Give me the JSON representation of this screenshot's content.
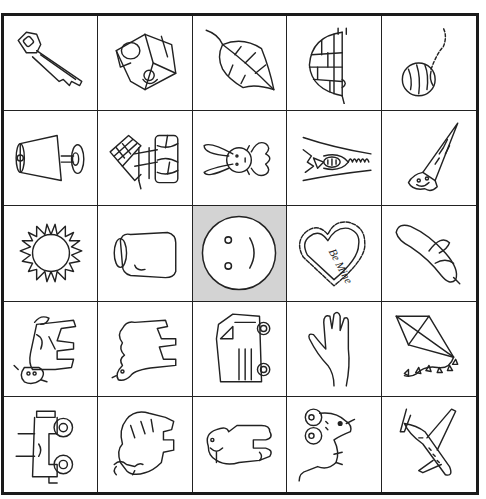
{
  "board": {
    "rows": 5,
    "cols": 5,
    "free_cell_color": "#d3d3d3",
    "cells": [
      {
        "label": "key",
        "icon": "key-icon"
      },
      {
        "label": "milk carton",
        "icon": "milk-carton-icon"
      },
      {
        "label": "leaf",
        "icon": "leaf-icon"
      },
      {
        "label": "igloo",
        "icon": "igloo-icon"
      },
      {
        "label": "yarn",
        "icon": "yarn-ball-icon"
      },
      {
        "label": "lamp",
        "icon": "lamp-icon"
      },
      {
        "label": "well",
        "icon": "wishing-well-icon"
      },
      {
        "label": "rabbit",
        "icon": "rabbit-icon"
      },
      {
        "label": "zipper",
        "icon": "zipper-icon"
      },
      {
        "label": "saw",
        "icon": "saw-icon"
      },
      {
        "label": "sun",
        "icon": "sun-icon"
      },
      {
        "label": "jar",
        "icon": "jar-icon"
      },
      {
        "label": "smiley face (free)",
        "icon": "smiley-face-icon"
      },
      {
        "label": "valentine heart",
        "icon": "heart-icon",
        "text": "Be Mine"
      },
      {
        "label": "banana",
        "icon": "banana-icon"
      },
      {
        "label": "cow",
        "icon": "cow-icon"
      },
      {
        "label": "camel",
        "icon": "camel-icon"
      },
      {
        "label": "van",
        "icon": "van-icon"
      },
      {
        "label": "hand",
        "icon": "hand-icon"
      },
      {
        "label": "kite",
        "icon": "kite-icon"
      },
      {
        "label": "jeep",
        "icon": "jeep-icon"
      },
      {
        "label": "yak",
        "icon": "yak-icon"
      },
      {
        "label": "walrus",
        "icon": "walrus-icon"
      },
      {
        "label": "mouse",
        "icon": "mouse-icon"
      },
      {
        "label": "jet",
        "icon": "jet-icon"
      }
    ]
  }
}
